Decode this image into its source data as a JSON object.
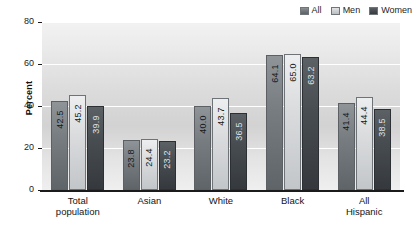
{
  "chart_data": {
    "type": "bar",
    "title": "",
    "xlabel": "",
    "ylabel": "Percent",
    "ylim": [
      0,
      80
    ],
    "yticks": [
      "0",
      "20",
      "40",
      "60",
      "80"
    ],
    "grid": true,
    "legend_position": "top-right",
    "categories": [
      "Total population",
      "Asian",
      "White",
      "Black",
      "All Hispanic"
    ],
    "category_lines": [
      [
        "Total",
        "population"
      ],
      [
        "Asian"
      ],
      [
        "White"
      ],
      [
        "Black"
      ],
      [
        "All",
        "Hispanic"
      ]
    ],
    "series": [
      {
        "name": "All",
        "color": "#787d82",
        "values": [
          42.5,
          23.8,
          40.0,
          64.1,
          41.4
        ],
        "labels": [
          "42.5",
          "23.8",
          "40.0",
          "64.1",
          "41.4"
        ]
      },
      {
        "name": "Men",
        "color": "#dadcde",
        "values": [
          45.2,
          24.4,
          43.7,
          65.0,
          44.4
        ],
        "labels": [
          "45.2",
          "24.4",
          "43.7",
          "65.0",
          "44.4"
        ]
      },
      {
        "name": "Women",
        "color": "#484d52",
        "values": [
          39.9,
          23.2,
          36.5,
          63.2,
          38.5
        ],
        "labels": [
          "39.9",
          "23.2",
          "36.5",
          "63.2",
          "38.5"
        ]
      }
    ]
  },
  "legend": {
    "items": [
      {
        "label": "All"
      },
      {
        "label": "Men"
      },
      {
        "label": "Women"
      }
    ]
  },
  "axis": {
    "y_title": "Percent"
  }
}
